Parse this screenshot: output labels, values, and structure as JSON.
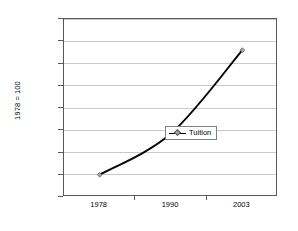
{
  "chart_data": {
    "type": "line",
    "title": "",
    "xlabel": "",
    "ylabel": "1978 = 100",
    "categories": [
      "1978",
      "1990",
      "2003"
    ],
    "series": [
      {
        "name": "Tuition",
        "values": [
          100,
          285,
          660
        ]
      }
    ],
    "ylim": [
      0,
      800
    ],
    "yticks": [
      "0",
      "100",
      "200",
      "300",
      "400",
      "500",
      "600",
      "700",
      "800"
    ],
    "grid": "horizontal",
    "legend_position": "inside-right-center",
    "colors": {
      "line": "#000000",
      "marker_fill": "#a6a6a6",
      "marker_border": "#595959",
      "gridline": "#c9c9c9",
      "frame": "#595959",
      "background": "#ffffff"
    }
  },
  "legend": {
    "entries": [
      {
        "label": "Tuition",
        "symbol": "line-with-diamond-marker"
      }
    ]
  }
}
